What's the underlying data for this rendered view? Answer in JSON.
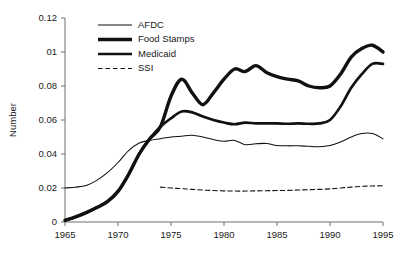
{
  "chart_data": {
    "type": "line",
    "title": "",
    "xlabel": "",
    "ylabel": "Number",
    "xlim": [
      1965,
      1995
    ],
    "ylim": [
      0,
      0.12
    ],
    "grid": false,
    "legend_position": "top-left-inside",
    "x_ticks": [
      1965,
      1970,
      1975,
      1980,
      1985,
      1990,
      1995
    ],
    "x_tick_labels": [
      "1965",
      "1970",
      "1975",
      "1980",
      "1985",
      "1990",
      "1995"
    ],
    "y_ticks": [
      0,
      0.02,
      0.04,
      0.06,
      0.08,
      0.1,
      0.12
    ],
    "y_tick_labels": [
      "0",
      "0.02",
      "0.04",
      "0.06",
      "0.08",
      "01",
      "0.12"
    ],
    "series": [
      {
        "name": "AFDC",
        "style": "thin",
        "x": [
          1965,
          1966,
          1967,
          1968,
          1969,
          1970,
          1971,
          1972,
          1973,
          1974,
          1975,
          1976,
          1977,
          1978,
          1979,
          1980,
          1981,
          1982,
          1983,
          1984,
          1985,
          1986,
          1987,
          1988,
          1989,
          1990,
          1991,
          1992,
          1993,
          1994,
          1995
        ],
        "y": [
          0.02,
          0.0205,
          0.0215,
          0.0245,
          0.029,
          0.035,
          0.042,
          0.0465,
          0.048,
          0.049,
          0.05,
          0.0505,
          0.051,
          0.05,
          0.0485,
          0.0475,
          0.048,
          0.0455,
          0.046,
          0.0462,
          0.045,
          0.0448,
          0.0448,
          0.0445,
          0.0443,
          0.045,
          0.047,
          0.05,
          0.052,
          0.052,
          0.049
        ]
      },
      {
        "name": "Food Stamps",
        "style": "thick",
        "x": [
          1965,
          1966,
          1967,
          1968,
          1969,
          1970,
          1971,
          1972,
          1973,
          1974,
          1975,
          1976,
          1977,
          1978,
          1979,
          1980,
          1981,
          1982,
          1983,
          1984,
          1985,
          1986,
          1987,
          1988,
          1989,
          1990,
          1991,
          1992,
          1993,
          1994,
          1995
        ],
        "y": [
          0.001,
          0.003,
          0.0055,
          0.0085,
          0.012,
          0.018,
          0.028,
          0.04,
          0.049,
          0.056,
          0.074,
          0.084,
          0.076,
          0.069,
          0.076,
          0.084,
          0.09,
          0.0885,
          0.092,
          0.088,
          0.0855,
          0.084,
          0.083,
          0.08,
          0.079,
          0.08,
          0.087,
          0.097,
          0.102,
          0.104,
          0.1
        ]
      },
      {
        "name": "Medicaid",
        "style": "medium",
        "x": [
          1965,
          1966,
          1967,
          1968,
          1969,
          1970,
          1971,
          1972,
          1973,
          1974,
          1975,
          1976,
          1977,
          1978,
          1979,
          1980,
          1981,
          1982,
          1983,
          1984,
          1985,
          1986,
          1987,
          1988,
          1989,
          1990,
          1991,
          1992,
          1993,
          1994,
          1995
        ],
        "y": [
          0.001,
          0.003,
          0.0055,
          0.0085,
          0.012,
          0.018,
          0.028,
          0.04,
          0.049,
          0.056,
          0.061,
          0.065,
          0.0645,
          0.062,
          0.06,
          0.0585,
          0.0575,
          0.0585,
          0.058,
          0.058,
          0.058,
          0.0578,
          0.058,
          0.0578,
          0.058,
          0.06,
          0.068,
          0.079,
          0.087,
          0.093,
          0.093
        ]
      },
      {
        "name": "SSI",
        "style": "dashed",
        "x": [
          1974,
          1975,
          1976,
          1977,
          1978,
          1979,
          1980,
          1981,
          1982,
          1983,
          1984,
          1985,
          1986,
          1987,
          1988,
          1989,
          1990,
          1991,
          1992,
          1993,
          1994,
          1995
        ],
        "y": [
          0.0205,
          0.02,
          0.0196,
          0.0192,
          0.0188,
          0.0185,
          0.0183,
          0.0182,
          0.0182,
          0.0183,
          0.0184,
          0.0185,
          0.0186,
          0.0188,
          0.019,
          0.0192,
          0.0195,
          0.02,
          0.0205,
          0.021,
          0.0212,
          0.0213
        ]
      }
    ]
  },
  "legend": {
    "items": [
      {
        "label": "AFDC",
        "style": "thin"
      },
      {
        "label": "Food Stamps",
        "style": "thick"
      },
      {
        "label": "Medicaid",
        "style": "medium"
      },
      {
        "label": "SSI",
        "style": "dashed"
      }
    ]
  }
}
